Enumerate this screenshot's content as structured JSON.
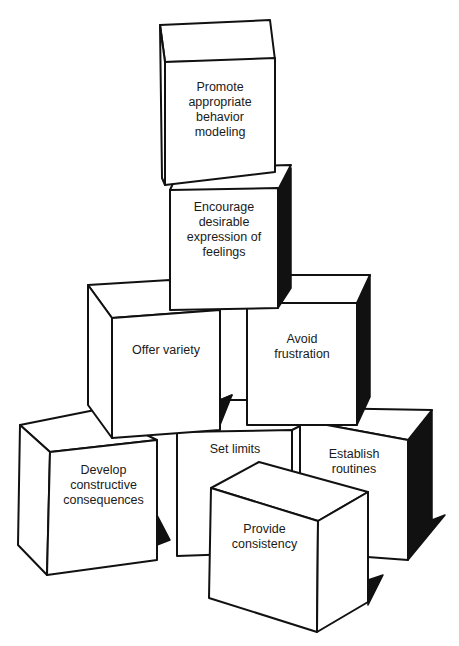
{
  "diagram": {
    "type": "block-pyramid",
    "colors": {
      "stroke": "#111111",
      "fill": "#ffffff",
      "shadow": "#111111",
      "text": "#1a1a1a"
    },
    "blocks": [
      {
        "id": "top",
        "tier": 1,
        "label": "Promote\nappropriate\nbehavior\nmodeling"
      },
      {
        "id": "second",
        "tier": 2,
        "label": "Encourage\ndesirable\nexpression of\nfeelings"
      },
      {
        "id": "middle-left",
        "tier": 3,
        "label": "Offer variety"
      },
      {
        "id": "middle-right",
        "tier": 3,
        "label": "Avoid\nfrustration"
      },
      {
        "id": "bottom-left",
        "tier": 4,
        "label": "Develop\nconstructive\nconsequences"
      },
      {
        "id": "bottom-center-back",
        "tier": 4,
        "label": "Set limits"
      },
      {
        "id": "bottom-right",
        "tier": 4,
        "label": "Establish\nroutines"
      },
      {
        "id": "bottom-front",
        "tier": 4,
        "label": "Provide\nconsistency"
      }
    ]
  }
}
